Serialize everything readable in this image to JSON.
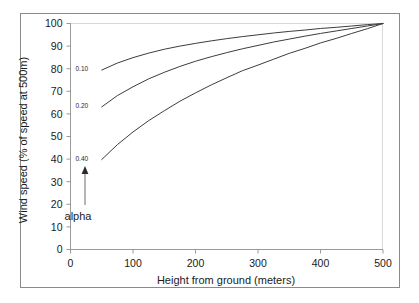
{
  "chart_data": {
    "type": "line",
    "title": "",
    "xlabel": "Height from ground (meters)",
    "ylabel": "Wind speed (% of speed at 500m)",
    "xlim": [
      0,
      500
    ],
    "ylim": [
      0,
      100
    ],
    "xticks": [
      "0",
      "100",
      "200",
      "300",
      "400",
      "500"
    ],
    "xtick_values": [
      0,
      100,
      200,
      300,
      400,
      500
    ],
    "yticks": [
      "0",
      "10",
      "20",
      "30",
      "40",
      "50",
      "60",
      "70",
      "80",
      "90",
      "100"
    ],
    "ytick_values": [
      0,
      10,
      20,
      30,
      40,
      50,
      60,
      70,
      80,
      90,
      100
    ],
    "grid": false,
    "legend_position": "inline-left-of-curves",
    "annotation": {
      "label": "alpha",
      "arrow": "up",
      "points_to": "alpha-series-labels"
    },
    "series": [
      {
        "name": "0.10",
        "label": "0.10",
        "alpha": 0.1,
        "color": "#3d3d3d",
        "x": [
          50,
          75,
          100,
          125,
          150,
          175,
          200,
          225,
          250,
          275,
          300,
          325,
          350,
          375,
          400,
          425,
          450,
          475,
          500
        ],
        "values": [
          79.4,
          82.5,
          84.9,
          86.9,
          88.6,
          90.0,
          91.2,
          92.3,
          93.3,
          94.2,
          95.0,
          95.8,
          96.5,
          97.1,
          97.8,
          98.3,
          98.9,
          99.5,
          100.0
        ]
      },
      {
        "name": "0.20",
        "label": "0.20",
        "alpha": 0.2,
        "color": "#3d3d3d",
        "x": [
          50,
          75,
          100,
          125,
          150,
          175,
          200,
          225,
          250,
          275,
          300,
          325,
          350,
          375,
          400,
          425,
          450,
          475,
          500
        ],
        "values": [
          63.1,
          68.1,
          72.0,
          75.5,
          78.4,
          81.0,
          83.3,
          85.3,
          87.1,
          88.8,
          90.3,
          91.8,
          93.1,
          94.4,
          95.6,
          96.7,
          97.8,
          98.9,
          100.0
        ]
      },
      {
        "name": "0.40",
        "label": "0.40",
        "alpha": 0.4,
        "color": "#3d3d3d",
        "x": [
          50,
          75,
          100,
          125,
          150,
          175,
          200,
          225,
          250,
          275,
          300,
          325,
          350,
          375,
          400,
          425,
          450,
          475,
          500
        ],
        "values": [
          39.8,
          46.4,
          52.0,
          57.0,
          61.4,
          65.6,
          69.3,
          72.8,
          76.0,
          79.1,
          81.6,
          84.2,
          86.8,
          89.0,
          91.4,
          93.4,
          95.6,
          97.7,
          100.0
        ]
      }
    ]
  }
}
